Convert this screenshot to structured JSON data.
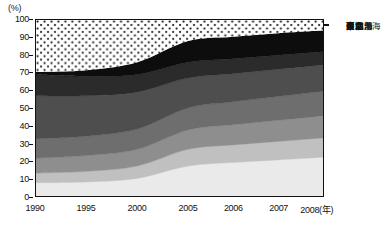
{
  "axes": {
    "y_unit": "(%)",
    "y_ticks": [
      "0",
      "10",
      "20",
      "30",
      "40",
      "50",
      "60",
      "70",
      "80",
      "90",
      "100"
    ],
    "x_ticks": [
      "1990",
      "1995",
      "2000",
      "2005",
      "2006",
      "2007",
      "2008"
    ],
    "x_unit": "(年)",
    "x_last_label": "2008(年)"
  },
  "legend": {
    "items": [
      {
        "label": "東北",
        "swatch": "dotted"
      },
      {
        "label": "中西部",
        "swatch": "#0d0d0d"
      },
      {
        "label": "西北",
        "swatch": "#2b2b2b"
      },
      {
        "label": "西南",
        "swatch": "#4e4e4e"
      },
      {
        "label": "環渤海",
        "swatch": "#6e6e6e"
      },
      {
        "label": "中南",
        "swatch": "#8e8e8e"
      },
      {
        "label": "東南沿海",
        "swatch": "#c0c0c0"
      },
      {
        "label": "長三角",
        "swatch": "#eaeaea"
      }
    ]
  },
  "chart_data": {
    "type": "area",
    "title": "",
    "xlabel": "(年)",
    "ylabel": "(%)",
    "ylim": [
      0,
      100
    ],
    "grid": false,
    "stacked": true,
    "normalized": true,
    "legend_position": "right",
    "x": [
      "1990",
      "1995",
      "2000",
      "2005",
      "2006",
      "2007",
      "2008"
    ],
    "series": [
      {
        "name": "長三角",
        "color": "#eaeaea",
        "values": [
          7.5,
          8.0,
          10.0,
          17.0,
          19.0,
          20.5,
          22.0
        ]
      },
      {
        "name": "東南沿海",
        "color": "#c0c0c0",
        "values": [
          5.5,
          6.0,
          7.0,
          9.5,
          10.0,
          10.5,
          11.0
        ]
      },
      {
        "name": "中南",
        "color": "#8e8e8e",
        "values": [
          8.5,
          9.0,
          9.5,
          11.0,
          11.5,
          12.0,
          12.5
        ]
      },
      {
        "name": "環渤海",
        "color": "#6e6e6e",
        "values": [
          11.0,
          11.0,
          11.5,
          12.5,
          13.0,
          13.5,
          14.0
        ]
      },
      {
        "name": "西南",
        "color": "#4e4e4e",
        "values": [
          24.5,
          23.0,
          21.0,
          17.0,
          16.0,
          15.5,
          15.0
        ]
      },
      {
        "name": "西北",
        "color": "#2b2b2b",
        "values": [
          12.0,
          11.0,
          10.0,
          9.0,
          8.5,
          8.0,
          7.5
        ]
      },
      {
        "name": "中西部",
        "color": "#0d0d0d",
        "values": [
          1.5,
          3.5,
          7.0,
          12.0,
          12.5,
          12.5,
          12.0
        ]
      },
      {
        "name": "東北",
        "color": "dotted",
        "values": [
          29.5,
          28.5,
          24.0,
          12.0,
          9.5,
          7.5,
          6.0
        ]
      }
    ],
    "boundaries_cumulative": {
      "長三角": [
        7.5,
        8.0,
        10.0,
        17.0,
        19.0,
        20.5,
        22.0
      ],
      "東南沿海": [
        13.0,
        14.0,
        17.0,
        26.5,
        29.0,
        31.0,
        33.0
      ],
      "中南": [
        21.5,
        23.0,
        26.5,
        37.5,
        40.5,
        43.0,
        45.5
      ],
      "環渤海": [
        32.5,
        34.0,
        38.0,
        50.0,
        53.5,
        56.5,
        59.5
      ],
      "西南": [
        57.0,
        57.0,
        59.0,
        67.0,
        69.5,
        72.0,
        74.5
      ],
      "西北": [
        69.0,
        68.0,
        69.0,
        76.0,
        78.0,
        80.0,
        82.0
      ],
      "中西部": [
        70.5,
        71.5,
        76.0,
        88.0,
        90.5,
        92.5,
        94.0
      ],
      "東北": [
        100,
        100,
        100,
        100,
        100,
        100,
        100
      ]
    }
  }
}
